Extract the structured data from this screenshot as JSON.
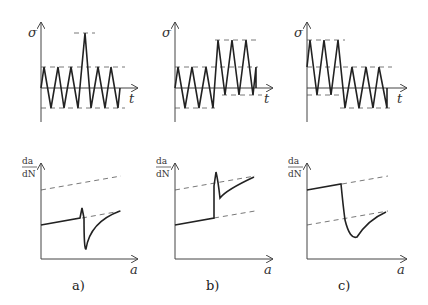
{
  "figure": {
    "panels": [
      {
        "caption": "a)",
        "top_ylabel": "σ",
        "top_xlabel": "t",
        "bottom_ylabel_num": "da",
        "bottom_ylabel_den": "dN",
        "bottom_xlabel": "a",
        "description": "Single overload spike: transient acceleration then retardation of crack growth"
      },
      {
        "caption": "b)",
        "top_ylabel": "σ",
        "top_xlabel": "t",
        "bottom_ylabel_num": "da",
        "bottom_ylabel_den": "dN",
        "bottom_xlabel": "a",
        "description": "Step increase in load amplitude: jump in crack growth rate"
      },
      {
        "caption": "c)",
        "top_ylabel": "σ",
        "top_xlabel": "t",
        "bottom_ylabel_num": "da",
        "bottom_ylabel_den": "dN",
        "bottom_xlabel": "a",
        "description": "Step decrease in load amplitude: retardation of crack growth rate"
      }
    ]
  },
  "colors": {
    "line": "#222222",
    "axis": "#444444",
    "dash": "#555555"
  }
}
